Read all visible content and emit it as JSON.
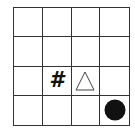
{
  "board": {
    "rows": 4,
    "cols": 4,
    "cells": [
      [
        "",
        "",
        "",
        ""
      ],
      [
        "",
        "",
        "",
        ""
      ],
      [
        "",
        "wall",
        "goal",
        ""
      ],
      [
        "",
        "",
        "",
        "agent"
      ]
    ]
  },
  "legend": {
    "wall": {
      "glyph": "#",
      "icon": "hash-icon"
    },
    "goal": {
      "glyph": "△",
      "icon": "triangle-icon"
    },
    "agent": {
      "glyph": "●",
      "icon": "circle-icon"
    }
  },
  "colors": {
    "grid_line": "#333333",
    "background": "#ffffff",
    "agent": "#111111",
    "triangle_stroke": "#444444"
  }
}
